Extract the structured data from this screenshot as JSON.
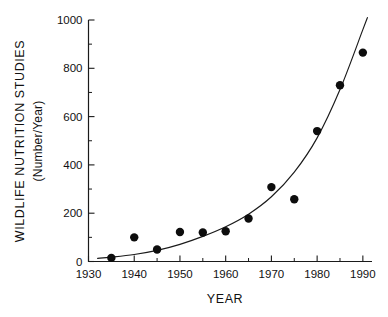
{
  "chart_data": {
    "type": "scatter",
    "title": "",
    "xlabel": "YEAR",
    "ylabel": "WILDLIFE NUTRITION STUDIES",
    "ylabel_sub": "(Number/Year)",
    "xlim": [
      1930,
      1992
    ],
    "ylim": [
      0,
      1000
    ],
    "grid": false,
    "legend": null,
    "x_ticks": [
      1930,
      1940,
      1950,
      1960,
      1970,
      1980,
      1990
    ],
    "x_tick_labels": [
      "1930",
      "1940",
      "1950",
      "1960",
      "1970",
      "1980",
      "1990"
    ],
    "x_minor_ticks": [
      1935,
      1945,
      1955,
      1965,
      1975,
      1985
    ],
    "y_ticks": [
      0,
      200,
      400,
      600,
      800,
      1000
    ],
    "y_tick_labels": [
      "0",
      "200",
      "400",
      "600",
      "800",
      "1000"
    ],
    "y_minor_ticks": [
      100,
      300,
      500,
      700,
      900
    ],
    "x": [
      1935,
      1940,
      1945,
      1950,
      1955,
      1960,
      1965,
      1970,
      1975,
      1980,
      1985,
      1990
    ],
    "values": [
      15,
      100,
      50,
      122,
      120,
      125,
      178,
      308,
      258,
      540,
      730,
      865
    ],
    "series": [
      {
        "name": "Wildlife nutrition studies per year",
        "marker": "filled-circle",
        "color": "#0d0d0d",
        "points": [
          {
            "x": 1935,
            "y": 15
          },
          {
            "x": 1940,
            "y": 100
          },
          {
            "x": 1945,
            "y": 50
          },
          {
            "x": 1950,
            "y": 122
          },
          {
            "x": 1955,
            "y": 120
          },
          {
            "x": 1960,
            "y": 125
          },
          {
            "x": 1965,
            "y": 178
          },
          {
            "x": 1970,
            "y": 308
          },
          {
            "x": 1975,
            "y": 258
          },
          {
            "x": 1980,
            "y": 540
          },
          {
            "x": 1985,
            "y": 730
          },
          {
            "x": 1990,
            "y": 865
          }
        ]
      },
      {
        "name": "Fitted exponential trend curve",
        "marker": "none",
        "color": "#1a1a1a",
        "curve": [
          {
            "x": 1932,
            "y": 13
          },
          {
            "x": 1935,
            "y": 18
          },
          {
            "x": 1940,
            "y": 29
          },
          {
            "x": 1945,
            "y": 46
          },
          {
            "x": 1950,
            "y": 71
          },
          {
            "x": 1955,
            "y": 104
          },
          {
            "x": 1960,
            "y": 144
          },
          {
            "x": 1965,
            "y": 196
          },
          {
            "x": 1970,
            "y": 268
          },
          {
            "x": 1975,
            "y": 370
          },
          {
            "x": 1980,
            "y": 512
          },
          {
            "x": 1985,
            "y": 712
          },
          {
            "x": 1990,
            "y": 960
          },
          {
            "x": 1991,
            "y": 1010
          }
        ]
      }
    ]
  }
}
